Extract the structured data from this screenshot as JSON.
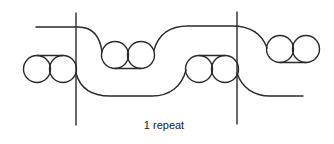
{
  "diagram": {
    "caption": "1 repeat",
    "stroke_color": "#2a2a2a",
    "background": "#ffffff",
    "repeat_markers": [
      {
        "name": "left-repeat-line",
        "x": 76,
        "y1": 13,
        "y2": 125
      },
      {
        "name": "right-repeat-line",
        "x": 237,
        "y1": 12,
        "y2": 124
      }
    ],
    "circle_pairs": [
      {
        "name": "circle-pair-1",
        "centers": [
          [
            37,
            69
          ],
          [
            63,
            69
          ]
        ],
        "r": 13.5,
        "tangent_line_y": 55.5,
        "tangent_side": "top"
      },
      {
        "name": "circle-pair-2",
        "centers": [
          [
            115,
            55
          ],
          [
            141,
            55
          ]
        ],
        "r": 13.5,
        "tangent_line_y": 68.5,
        "tangent_side": "bottom"
      },
      {
        "name": "circle-pair-3",
        "centers": [
          [
            199,
            69
          ],
          [
            225,
            69
          ]
        ],
        "r": 13.5,
        "tangent_line_y": 55.5,
        "tangent_side": "top"
      },
      {
        "name": "circle-pair-4",
        "centers": [
          [
            280,
            49
          ],
          [
            306,
            49
          ]
        ],
        "r": 13.5,
        "tangent_line_y": 62.5,
        "tangent_side": "bottom"
      }
    ]
  }
}
